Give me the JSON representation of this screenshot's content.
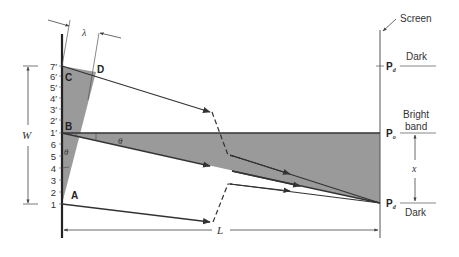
{
  "diagram": {
    "title_labels": {
      "screen": "Screen",
      "lambda": "λ",
      "width": "W",
      "length": "L",
      "x": "x",
      "theta_upper": "θ",
      "theta_lower": "θ"
    },
    "points": {
      "A": "A",
      "B": "B",
      "C": "C",
      "D": "D"
    },
    "slit_ticks_upper": [
      "7′",
      "6′",
      "5′",
      "4′",
      "3′",
      "2′",
      "1′"
    ],
    "slit_ticks_lower": [
      "6",
      "5",
      "4",
      "3",
      "2",
      "1"
    ],
    "screen_labels": {
      "pd_top": "P",
      "pd_top_sub": "d",
      "dark_top": "Dark",
      "po": "P",
      "po_sub": "o",
      "bright_band_1": "Bright",
      "bright_band_2": "band",
      "pd_bottom": "P",
      "pd_bottom_sub": "d",
      "dark_bottom": "Dark"
    },
    "colors": {
      "shade": "#9a9a9a",
      "line": "#333333",
      "thin": "#555555"
    }
  }
}
